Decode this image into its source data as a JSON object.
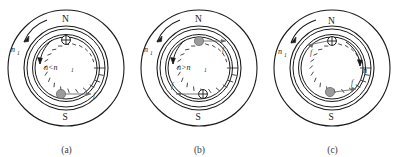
{
  "figure": {
    "type": "diagram",
    "panel_count": 3,
    "colors": {
      "outline": "#1a1a1a",
      "conductor_into_page_fill": "#9a9a9a",
      "label_gray": "#4a4a4a",
      "background": "#ffffff"
    },
    "panels": [
      {
        "id": "a",
        "caption": "(a)",
        "pole_top": "N",
        "pole_bottom": "S",
        "field_speed_label": "n",
        "field_speed_sub": "1",
        "rotor_relation": "n<n",
        "rotor_relation_sub": "1",
        "force_labels": [
          "f"
        ],
        "conductor_top_symbol": "⊕",
        "conductor_bottom_symbol": "●",
        "field_arrow_direction": "counterclockwise",
        "rotor_arrow_direction": "counterclockwise",
        "force_top_direction": "none",
        "force_bottom_direction": "right"
      },
      {
        "id": "b",
        "caption": "(b)",
        "pole_top": "N",
        "pole_bottom": "S",
        "field_speed_label": "n",
        "field_speed_sub": "1",
        "rotor_relation": "n>n",
        "rotor_relation_sub": "1",
        "force_labels": [
          "f",
          "f"
        ],
        "conductor_top_symbol": "●",
        "conductor_bottom_symbol": "⊕",
        "field_arrow_direction": "counterclockwise",
        "rotor_arrow_direction": "counterclockwise",
        "force_top_direction": "right",
        "force_bottom_direction": "left"
      },
      {
        "id": "c",
        "caption": "(c)",
        "pole_top": "N",
        "pole_bottom": "S",
        "field_speed_label": "n",
        "field_speed_sub": "1",
        "rotor_speed_label": "n",
        "force_labels": [
          "f",
          "f"
        ],
        "conductor_top_symbol": "⊕",
        "conductor_bottom_symbol": "●",
        "field_arrow_direction": "counterclockwise",
        "rotor_arrow_direction": "clockwise",
        "force_top_direction": "left",
        "force_bottom_direction": "right"
      }
    ]
  }
}
